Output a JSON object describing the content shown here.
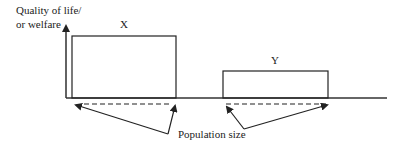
{
  "diagram": {
    "y_axis_label_line1": "Quality of life/",
    "y_axis_label_line2": "or welfare",
    "box_x_label": "X",
    "box_y_label": "Y",
    "annotation": "Population size",
    "colors": {
      "line": "#222222",
      "background": "#ffffff"
    }
  }
}
